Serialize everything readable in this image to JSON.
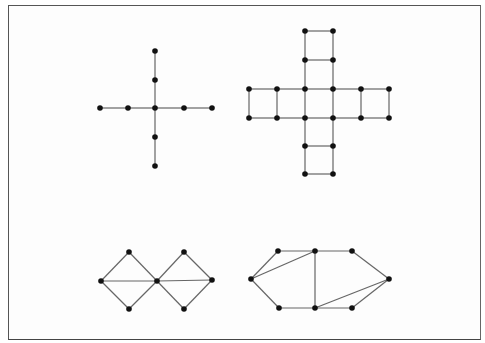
{
  "figure": {
    "frame": {
      "x": 8,
      "y": 5,
      "width": 472,
      "height": 334
    },
    "colors": {
      "edge": "#666666",
      "node": "#111111",
      "border": "#555555",
      "background": "#ffffff"
    },
    "node_radius": 2.8,
    "graphs": [
      {
        "name": "cross-graph",
        "nodes": [
          [
            155,
            51
          ],
          [
            155,
            80
          ],
          [
            100,
            108
          ],
          [
            128,
            108
          ],
          [
            155,
            108
          ],
          [
            184,
            108
          ],
          [
            212,
            108
          ],
          [
            155,
            137
          ],
          [
            155,
            166
          ]
        ],
        "edges": [
          [
            0,
            1
          ],
          [
            1,
            4
          ],
          [
            2,
            3
          ],
          [
            3,
            4
          ],
          [
            4,
            5
          ],
          [
            5,
            6
          ],
          [
            4,
            7
          ],
          [
            7,
            8
          ]
        ]
      },
      {
        "name": "grid-cross-graph",
        "nodes": [
          [
            305,
            31
          ],
          [
            333,
            31
          ],
          [
            305,
            60
          ],
          [
            333,
            60
          ],
          [
            249,
            89
          ],
          [
            277,
            89
          ],
          [
            305,
            89
          ],
          [
            333,
            89
          ],
          [
            361,
            89
          ],
          [
            389,
            89
          ],
          [
            249,
            118
          ],
          [
            277,
            118
          ],
          [
            305,
            118
          ],
          [
            333,
            118
          ],
          [
            361,
            118
          ],
          [
            389,
            118
          ],
          [
            305,
            146
          ],
          [
            333,
            146
          ],
          [
            305,
            174
          ],
          [
            333,
            174
          ]
        ],
        "edges": [
          [
            0,
            1
          ],
          [
            0,
            2
          ],
          [
            1,
            3
          ],
          [
            2,
            3
          ],
          [
            2,
            6
          ],
          [
            3,
            7
          ],
          [
            4,
            5
          ],
          [
            5,
            6
          ],
          [
            6,
            7
          ],
          [
            7,
            8
          ],
          [
            8,
            9
          ],
          [
            10,
            11
          ],
          [
            11,
            12
          ],
          [
            12,
            13
          ],
          [
            13,
            14
          ],
          [
            14,
            15
          ],
          [
            4,
            10
          ],
          [
            5,
            11
          ],
          [
            6,
            12
          ],
          [
            7,
            13
          ],
          [
            8,
            14
          ],
          [
            9,
            15
          ],
          [
            12,
            16
          ],
          [
            13,
            17
          ],
          [
            16,
            17
          ],
          [
            16,
            18
          ],
          [
            17,
            19
          ],
          [
            18,
            19
          ]
        ]
      },
      {
        "name": "double-diamond-graph",
        "nodes": [
          [
            101,
            281
          ],
          [
            129,
            252
          ],
          [
            129,
            309
          ],
          [
            157,
            281
          ],
          [
            184,
            252
          ],
          [
            184,
            309
          ],
          [
            212,
            280
          ]
        ],
        "edges": [
          [
            0,
            1
          ],
          [
            0,
            2
          ],
          [
            1,
            3
          ],
          [
            2,
            3
          ],
          [
            0,
            3
          ],
          [
            3,
            4
          ],
          [
            3,
            5
          ],
          [
            4,
            6
          ],
          [
            5,
            6
          ],
          [
            3,
            6
          ]
        ]
      },
      {
        "name": "hexagon-triangulated-graph",
        "nodes": [
          [
            251,
            279
          ],
          [
            278,
            251
          ],
          [
            315,
            251
          ],
          [
            352,
            251
          ],
          [
            389,
            279
          ],
          [
            279,
            308
          ],
          [
            315,
            308
          ],
          [
            352,
            308
          ]
        ],
        "edges": [
          [
            0,
            1
          ],
          [
            1,
            2
          ],
          [
            2,
            3
          ],
          [
            3,
            4
          ],
          [
            0,
            5
          ],
          [
            5,
            6
          ],
          [
            6,
            7
          ],
          [
            7,
            4
          ],
          [
            0,
            2
          ],
          [
            2,
            6
          ],
          [
            6,
            4
          ]
        ]
      }
    ]
  }
}
